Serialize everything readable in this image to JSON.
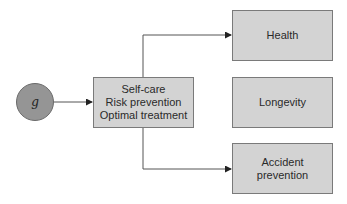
{
  "source_node": {
    "label": "g"
  },
  "center_node": {
    "lines": [
      "Self-care",
      "Risk prevention",
      "Optimal treatment"
    ]
  },
  "outcomes": [
    {
      "label": "Health"
    },
    {
      "label": "Longevity"
    },
    {
      "label": "Accident prevention",
      "lines": [
        "Accident",
        "prevention"
      ]
    }
  ],
  "colors": {
    "box_fill": "#d3d3d3",
    "circle_fill": "#959595",
    "line": "#555555"
  }
}
